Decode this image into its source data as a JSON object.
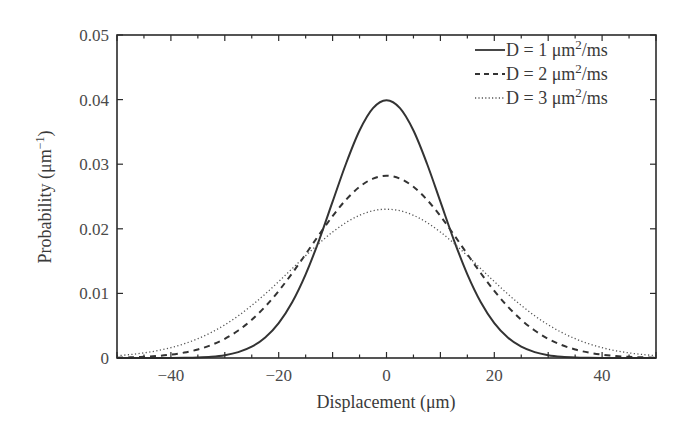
{
  "chart_data": {
    "type": "line",
    "title": "",
    "xlabel": "Displacement (μm)",
    "ylabel": "Probability (μm⁻¹)",
    "xlim": [
      -50,
      50
    ],
    "ylim": [
      0,
      0.05
    ],
    "xticks": [
      -40,
      -20,
      0,
      20,
      40
    ],
    "xtick_labels": [
      "−40",
      "−20",
      "0",
      "20",
      "40"
    ],
    "yticks": [
      0,
      0.01,
      0.02,
      0.03,
      0.04,
      0.05
    ],
    "ytick_labels": [
      "0",
      "0.01",
      "0.02",
      "0.03",
      "0.04",
      "0.05"
    ],
    "grid": false,
    "legend_position": "upper right",
    "x": [
      0,
      2.5,
      5,
      7.5,
      10,
      12.5,
      15,
      17.5,
      20,
      22.5,
      25,
      27.5,
      30,
      32.5,
      35,
      37.5,
      40,
      42.5,
      45,
      47.5,
      50
    ],
    "x_note": "curves are symmetric about x = 0; values listed for x >= 0",
    "series": [
      {
        "name": "D = 1 μm²/ms",
        "style": "solid",
        "values": [
          0.03989,
          0.03867,
          0.03521,
          0.03011,
          0.0242,
          0.01826,
          0.01295,
          0.00863,
          0.0054,
          0.00317,
          0.00175,
          0.00091,
          0.00044,
          0.0002,
          9e-05,
          4e-05,
          1e-05,
          0.0,
          0.0,
          0.0,
          0.0
        ]
      },
      {
        "name": "D = 2 μm²/ms",
        "style": "dashed",
        "values": [
          0.02821,
          0.02777,
          0.0265,
          0.02451,
          0.02197,
          0.01909,
          0.01607,
          0.01312,
          0.01038,
          0.00796,
          0.00591,
          0.00426,
          0.00297,
          0.00201,
          0.00132,
          0.00084,
          0.00052,
          0.00031,
          0.00018,
          0.0001,
          5e-05
        ]
      },
      {
        "name": "D = 3 μm²/ms",
        "style": "dotted",
        "values": [
          0.02303,
          0.0228,
          0.02209,
          0.02097,
          0.0195,
          0.01775,
          0.01583,
          0.01383,
          0.01183,
          0.00991,
          0.00813,
          0.00653,
          0.00514,
          0.00396,
          0.00299,
          0.00221,
          0.0016,
          0.00113,
          0.00079,
          0.00054,
          0.00036
        ]
      }
    ]
  },
  "legend": {
    "items": [
      {
        "prefix": "D = 1 μm",
        "sup": "2",
        "suffix": "/ms"
      },
      {
        "prefix": "D = 2 μm",
        "sup": "2",
        "suffix": "/ms"
      },
      {
        "prefix": "D = 3 μm",
        "sup": "2",
        "suffix": "/ms"
      }
    ]
  },
  "axes": {
    "xlabel": "Displacement (μm)",
    "ylabel_main": "Probability (μm",
    "ylabel_sup": "−1",
    "ylabel_close": ")"
  },
  "colors": {
    "axis": "#2b2b2b",
    "line": "#333333",
    "text": "#3a3a3a"
  }
}
